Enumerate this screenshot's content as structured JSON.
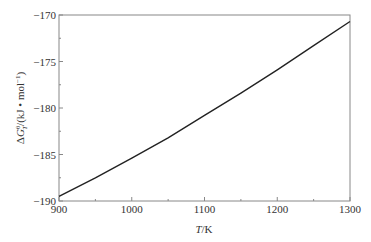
{
  "chart_data": {
    "type": "line",
    "title": "",
    "xlabel": "T/K",
    "ylabel": "ΔG_T^θ/(kJ·mol⁻¹)",
    "xlim": [
      900,
      1300
    ],
    "ylim": [
      -190,
      -170
    ],
    "xticks": [
      900,
      1000,
      1100,
      1200,
      1300
    ],
    "yticks": [
      -190,
      -185,
      -180,
      -175,
      -170
    ],
    "x_minor_ticks": [
      950,
      1050,
      1150,
      1250
    ],
    "y_minor_ticks": [
      -187.5,
      -182.5,
      -177.5,
      -172.5
    ],
    "grid": false,
    "legend": null,
    "series": [
      {
        "name": "ΔG_T^θ",
        "x": [
          900,
          950,
          1000,
          1050,
          1100,
          1150,
          1200,
          1250,
          1300
        ],
        "values": [
          -189.5,
          -187.5,
          -185.4,
          -183.2,
          -180.8,
          -178.4,
          -175.9,
          -173.3,
          -170.7
        ]
      }
    ]
  },
  "axes": {
    "x_label_italic": "T",
    "x_label_rest": "/K",
    "y_label_delta": "Δ",
    "y_label_G": "G",
    "y_label_sup": "θ",
    "y_label_sub": "T",
    "y_label_rest": "/(kJ • mol",
    "y_label_exp": "−1",
    "y_label_close": ")"
  },
  "colors": {
    "line": "#222222",
    "axis": "#888888",
    "text": "#333333"
  }
}
